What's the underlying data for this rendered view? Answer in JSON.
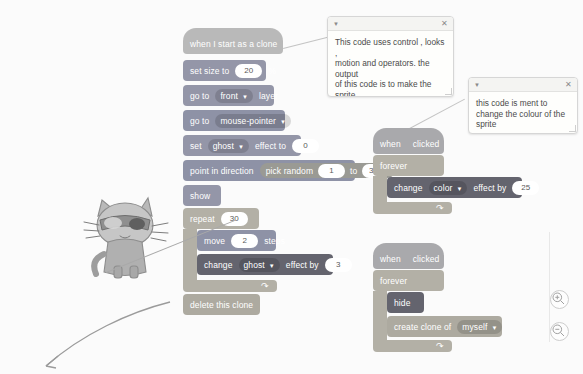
{
  "app": {
    "name": "Scratch Code Area",
    "background_color": "#fbfbfb"
  },
  "comments": [
    {
      "id": "comment-main",
      "collapse_icon": "triangle-down-icon",
      "close_icon": "close-icon",
      "text": "This code uses control , looks ,\nmotion and operators. the output\nof this code is to make the sprite\nfollow the mouse pointer and\nmake art."
    },
    {
      "id": "comment-color",
      "collapse_icon": "triangle-down-icon",
      "close_icon": "close-icon",
      "text": "this code is ment to\nchange the colour of the\nsprite"
    }
  ],
  "scripts": {
    "clone_script": {
      "hat": {
        "label": "when I start as a clone"
      },
      "blocks": [
        {
          "name": "set-size-to",
          "pre": "set size to",
          "value": "20",
          "post": "%"
        },
        {
          "name": "go-to-layer",
          "pre": "go to",
          "dropdown": "front",
          "post": "layer"
        },
        {
          "name": "go-to-target",
          "pre": "go to",
          "dropdown": "mouse-pointer"
        },
        {
          "name": "set-effect-to",
          "pre": "set",
          "dropdown": "ghost",
          "mid": "effect to",
          "value": "0"
        },
        {
          "name": "point-in-direction",
          "pre": "point in direction",
          "operator": "pick random",
          "value1": "1",
          "mid": "to",
          "value2": "360"
        },
        {
          "name": "show",
          "pre": "show"
        },
        {
          "name": "repeat",
          "pre": "repeat",
          "value": "30"
        },
        {
          "name": "move-steps",
          "pre": "move",
          "value": "2",
          "post": "steps"
        },
        {
          "name": "change-effect-by",
          "pre": "change",
          "dropdown": "ghost",
          "mid": "effect by",
          "value": "3"
        },
        {
          "name": "delete-this-clone",
          "pre": "delete this clone"
        }
      ]
    },
    "color_script": {
      "hat": {
        "pre": "when",
        "icon": "green-flag-icon",
        "post": "clicked"
      },
      "forever_label": "forever",
      "body": {
        "name": "change-effect-by",
        "pre": "change",
        "dropdown": "color",
        "mid": "effect by",
        "value": "25"
      }
    },
    "clone_spawn_script": {
      "hat": {
        "pre": "when",
        "icon": "green-flag-icon",
        "post": "clicked"
      },
      "forever_label": "forever",
      "body": [
        {
          "name": "hide",
          "pre": "hide"
        },
        {
          "name": "create-clone-of",
          "pre": "create clone of",
          "dropdown": "myself"
        }
      ]
    }
  },
  "sprite": {
    "name": "cat-sprite",
    "description": "cartoon cat wearing goggles holding a pointer"
  },
  "controls": {
    "zoom_in": "zoom-in-icon",
    "zoom_out": "zoom-out-icon"
  },
  "annotations": {
    "pointer_arrow": "arrow-annotation"
  }
}
